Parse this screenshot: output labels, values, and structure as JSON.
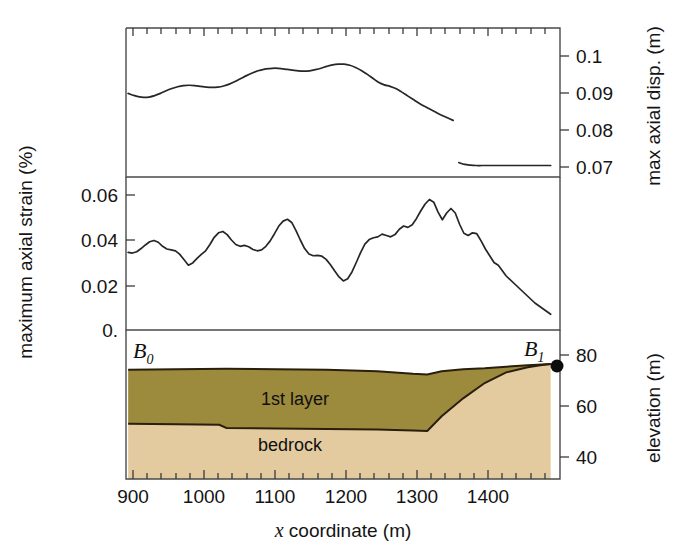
{
  "figure": {
    "type": "multi-panel-profile",
    "width": 686,
    "height": 557,
    "background": "#ffffff"
  },
  "axes": {
    "x": {
      "label": "x coordinate (m)",
      "label_italic_part": "x",
      "label_rest": " coordinate (m)",
      "min": 890,
      "max": 1495,
      "major_ticks": [
        900,
        1000,
        1100,
        1200,
        1300,
        1400
      ],
      "tick_labels": [
        "900",
        "1000",
        "1100",
        "1200",
        "1300",
        "1400"
      ],
      "minor_tick_step": 20
    },
    "left": {
      "label": "maximum axial strain (%)",
      "ticks": [
        0.06,
        0.04,
        0.02,
        0.0
      ],
      "tick_labels": [
        "0.06",
        "0.04",
        "0.02",
        "0."
      ],
      "min": 0.0,
      "max": 0.068
    },
    "right_top": {
      "label": "max  axial disp. (m)",
      "ticks": [
        0.1,
        0.09,
        0.08,
        0.07
      ],
      "tick_labels": [
        "0.1",
        "0.09",
        "0.08",
        "0.07"
      ],
      "min": 0.066,
      "max": 0.104
    },
    "right_bottom": {
      "label": "elevation (m)",
      "ticks": [
        80,
        60,
        40
      ],
      "tick_labels": [
        "80",
        "60",
        "40"
      ],
      "min": 28,
      "max": 86
    }
  },
  "geology": {
    "layer_names": [
      "1st layer",
      "bedrock"
    ],
    "colors": {
      "first_layer": "#9c8a3d",
      "bedrock": "#e3cb9f",
      "outline": "#2a1e0c"
    },
    "boundary_markers": [
      {
        "name": "B0",
        "base": "B",
        "sub": "0",
        "x": 893
      },
      {
        "name": "B1",
        "base": "B",
        "sub": "1",
        "x": 1482,
        "has_dot": true
      }
    ]
  },
  "chart_data": {
    "type": "line",
    "title": "",
    "xlabel": "x coordinate (m)",
    "panels": [
      {
        "id": "max-axial-displacement",
        "ylabel": "max  axial disp. (m)",
        "ylim": [
          0.066,
          0.104
        ],
        "units": "m",
        "x": [
          893,
          900,
          907,
          915,
          922,
          930,
          938,
          946,
          954,
          962,
          970,
          978,
          986,
          994,
          1002,
          1010,
          1018,
          1026,
          1034,
          1042,
          1050,
          1058,
          1066,
          1074,
          1082,
          1090,
          1098,
          1106,
          1114,
          1122,
          1130,
          1138,
          1146,
          1154,
          1162,
          1170,
          1178,
          1186,
          1194,
          1202,
          1210,
          1218,
          1226,
          1234,
          1242,
          1250,
          1258,
          1266,
          1274,
          1282,
          1290,
          1298,
          1306,
          1314,
          1322,
          1330,
          1338,
          1346,
          1354,
          1362,
          1370,
          1378,
          1386,
          1394,
          1402,
          1420,
          1440,
          1460,
          1482
        ],
        "values": [
          0.0899,
          0.0894,
          0.089,
          0.0888,
          0.0889,
          0.0893,
          0.0899,
          0.0906,
          0.0912,
          0.0917,
          0.092,
          0.0921,
          0.092,
          0.0918,
          0.0916,
          0.0915,
          0.0916,
          0.0919,
          0.0924,
          0.0931,
          0.0939,
          0.0947,
          0.0954,
          0.096,
          0.0964,
          0.0966,
          0.0967,
          0.0966,
          0.0964,
          0.0962,
          0.096,
          0.0959,
          0.096,
          0.0963,
          0.0967,
          0.0972,
          0.0976,
          0.0978,
          0.0978,
          0.0975,
          0.0969,
          0.0961,
          0.0951,
          0.094,
          0.0929,
          0.0922,
          0.0918,
          0.0912,
          0.0903,
          0.0893,
          0.0883,
          0.0873,
          0.0864,
          0.0856,
          0.0848,
          0.084,
          0.0833,
          0.0826,
          0.0712,
          0.0707,
          0.0705,
          0.0704,
          0.0704,
          0.0704,
          0.0704,
          0.0704,
          0.0704,
          0.0704,
          0.0704
        ]
      },
      {
        "id": "maximum-axial-strain",
        "ylabel": "maximum axial strain (%)",
        "ylim": [
          0.0,
          0.068
        ],
        "units": "%",
        "x": [
          893,
          899,
          905,
          911,
          917,
          923,
          929,
          935,
          941,
          947,
          953,
          959,
          965,
          971,
          977,
          983,
          989,
          995,
          1001,
          1007,
          1013,
          1019,
          1025,
          1031,
          1037,
          1043,
          1049,
          1055,
          1061,
          1067,
          1073,
          1079,
          1085,
          1091,
          1097,
          1103,
          1109,
          1115,
          1121,
          1127,
          1133,
          1139,
          1145,
          1151,
          1157,
          1163,
          1169,
          1175,
          1181,
          1187,
          1193,
          1199,
          1205,
          1211,
          1217,
          1223,
          1229,
          1235,
          1241,
          1247,
          1253,
          1259,
          1265,
          1271,
          1277,
          1283,
          1289,
          1295,
          1301,
          1307,
          1313,
          1319,
          1325,
          1331,
          1337,
          1343,
          1349,
          1355,
          1361,
          1367,
          1373,
          1379,
          1385,
          1391,
          1397,
          1403,
          1409,
          1420,
          1440,
          1460,
          1482
        ],
        "values": [
          0.0345,
          0.0342,
          0.0348,
          0.0362,
          0.0378,
          0.0392,
          0.0398,
          0.039,
          0.0372,
          0.036,
          0.0356,
          0.0352,
          0.0336,
          0.0312,
          0.0288,
          0.0298,
          0.0318,
          0.0336,
          0.0352,
          0.038,
          0.0412,
          0.0432,
          0.0438,
          0.0424,
          0.04,
          0.038,
          0.0372,
          0.0376,
          0.037,
          0.0358,
          0.0352,
          0.0356,
          0.0372,
          0.0396,
          0.0428,
          0.0462,
          0.0484,
          0.0492,
          0.0478,
          0.0442,
          0.04,
          0.0362,
          0.0338,
          0.033,
          0.0332,
          0.0328,
          0.0314,
          0.029,
          0.0262,
          0.0236,
          0.0218,
          0.0228,
          0.0258,
          0.03,
          0.0344,
          0.0382,
          0.0402,
          0.041,
          0.0414,
          0.0426,
          0.042,
          0.0414,
          0.0424,
          0.0448,
          0.0462,
          0.0456,
          0.0468,
          0.0496,
          0.053,
          0.056,
          0.058,
          0.0568,
          0.0524,
          0.049,
          0.052,
          0.054,
          0.052,
          0.047,
          0.043,
          0.042,
          0.0432,
          0.0428,
          0.0396,
          0.036,
          0.033,
          0.03,
          0.0288,
          0.024,
          0.018,
          0.012,
          0.007,
          0.004,
          0.002,
          0.0008,
          0.0002,
          0.0,
          0.0,
          0.0,
          0.0
        ]
      },
      {
        "id": "cross-section",
        "ylabel": "elevation (m)",
        "ylim": [
          28,
          86
        ],
        "units": "m",
        "ground_surface": {
          "x": [
            893,
            960,
            1030,
            1100,
            1170,
            1240,
            1290,
            1310,
            1330,
            1360,
            1390,
            1420,
            1450,
            1470,
            1482
          ],
          "y": [
            74.2,
            74.4,
            74.6,
            74.4,
            74.2,
            73.6,
            72.6,
            72.4,
            73.6,
            74.4,
            74.8,
            75.4,
            76.0,
            76.3,
            76.5
          ]
        },
        "bedrock_top": {
          "x": [
            893,
            960,
            1020,
            1030,
            1100,
            1170,
            1240,
            1290,
            1310,
            1330,
            1360,
            1390,
            1420,
            1450,
            1470,
            1482
          ],
          "y": [
            53.0,
            52.8,
            52.6,
            51.4,
            51.2,
            51.0,
            50.8,
            50.4,
            50.2,
            56.0,
            63.0,
            69.0,
            73.2,
            75.2,
            76.1,
            76.5
          ]
        }
      }
    ]
  }
}
